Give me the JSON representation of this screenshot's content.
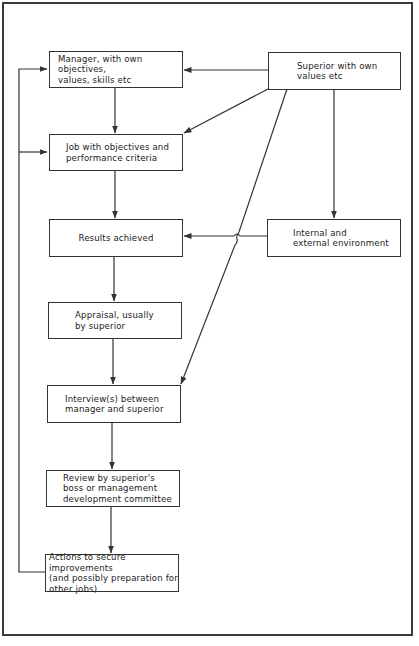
{
  "diagram": {
    "type": "flowchart",
    "title": "",
    "nodes": [
      {
        "id": "manager",
        "label": "Manager, with own objectives,\nvalues, skills etc"
      },
      {
        "id": "superior",
        "label": "Superior with own\nvalues etc"
      },
      {
        "id": "job",
        "label": "Job with objectives and\nperformance criteria"
      },
      {
        "id": "results",
        "label": "Results achieved"
      },
      {
        "id": "environment",
        "label": "Internal and\nexternal environment"
      },
      {
        "id": "appraisal",
        "label": "Appraisal, usually\nby superior"
      },
      {
        "id": "interview",
        "label": "Interview(s) between\nmanager and superior"
      },
      {
        "id": "review",
        "label": "Review by superior's\nboss or management\ndevelopment committee"
      },
      {
        "id": "actions",
        "label": "Actions to secure improvements\n(and possibly preparation for\nother jobs)"
      }
    ],
    "edges": [
      {
        "from": "superior",
        "to": "manager"
      },
      {
        "from": "superior",
        "to": "job"
      },
      {
        "from": "superior",
        "to": "interview"
      },
      {
        "from": "superior",
        "to": "environment"
      },
      {
        "from": "manager",
        "to": "job"
      },
      {
        "from": "job",
        "to": "results"
      },
      {
        "from": "environment",
        "to": "results"
      },
      {
        "from": "results",
        "to": "appraisal"
      },
      {
        "from": "appraisal",
        "to": "interview"
      },
      {
        "from": "interview",
        "to": "review"
      },
      {
        "from": "review",
        "to": "actions"
      },
      {
        "from": "actions",
        "to": "manager",
        "type": "feedback"
      },
      {
        "from": "actions",
        "to": "job",
        "type": "feedback"
      }
    ]
  }
}
